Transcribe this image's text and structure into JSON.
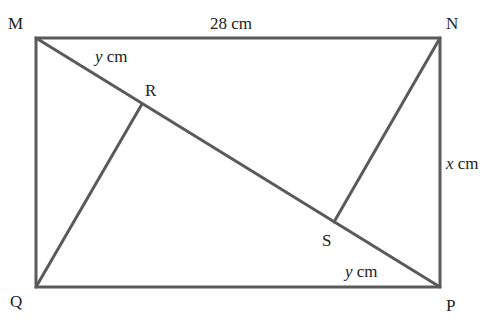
{
  "diagram": {
    "type": "geometry-rectangle",
    "vertices": {
      "M": {
        "label": "M",
        "x": 36,
        "y": 38
      },
      "N": {
        "label": "N",
        "x": 440,
        "y": 38
      },
      "P": {
        "label": "P",
        "x": 440,
        "y": 287
      },
      "Q": {
        "label": "Q",
        "x": 36,
        "y": 287
      },
      "R": {
        "label": "R",
        "x": 142,
        "y": 104
      },
      "S": {
        "label": "S",
        "x": 334,
        "y": 222
      }
    },
    "labels": {
      "top": "28 cm",
      "right_var": "x",
      "right_unit": " cm",
      "mr_var": "y",
      "mr_unit": " cm",
      "sp_var": "y",
      "sp_unit": " cm"
    },
    "line_color": "#5a5a5a"
  }
}
